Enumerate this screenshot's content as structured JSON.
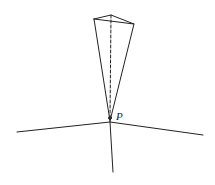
{
  "diagram": {
    "type": "geometry-figure",
    "labels": {
      "apex": "P"
    },
    "colors": {
      "line": "#222222",
      "background": "#ffffff"
    }
  }
}
